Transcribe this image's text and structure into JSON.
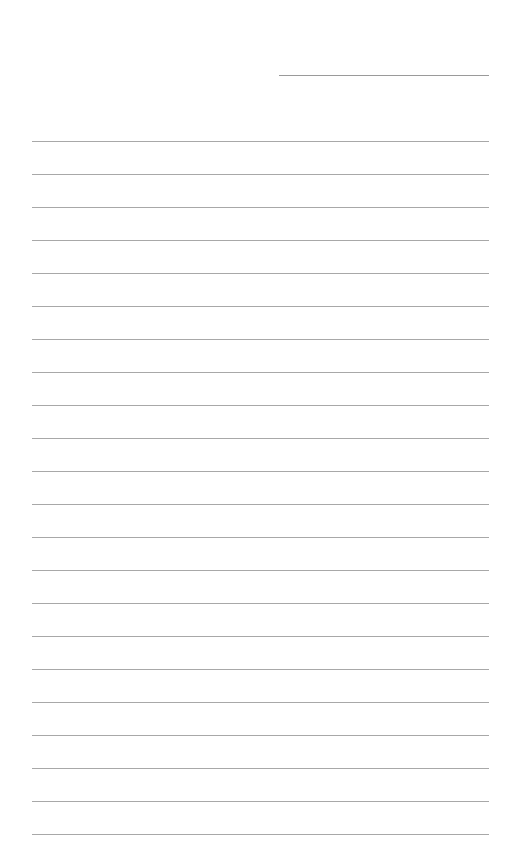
{
  "document": {
    "type": "lined-paper",
    "background_color": "#ffffff",
    "line_color": "#a8a8a8",
    "header_line": {
      "present": true,
      "label": ""
    },
    "ruled_line_count": 22,
    "line_spacing_px": 33,
    "lines": [
      "",
      "",
      "",
      "",
      "",
      "",
      "",
      "",
      "",
      "",
      "",
      "",
      "",
      "",
      "",
      "",
      "",
      "",
      "",
      "",
      "",
      ""
    ]
  }
}
